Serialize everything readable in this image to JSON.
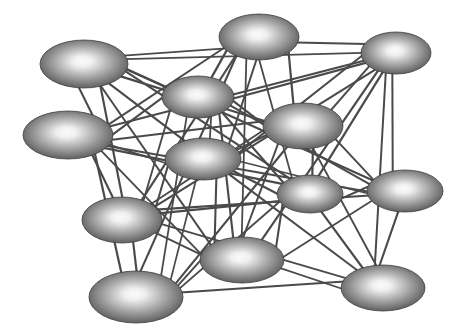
{
  "figure": {
    "type": "node-link-diagram",
    "width": 466,
    "height": 332,
    "background_color": "#ffffff",
    "node_count": 14,
    "edge_count": 86
  },
  "style": {
    "edge_color": "#4a4a4a",
    "edge_width": 2.0,
    "node_fill_center": "#f2f2f2",
    "node_fill_mid": "#9a9a9a",
    "node_fill_edge": "#4e4e4e",
    "node_outline": "#3d3d3d",
    "node_outline_width": 0.8
  },
  "nodes": [
    {
      "id": "n1",
      "label": "node-top-left",
      "cx": 84,
      "cy": 64,
      "rx": 44,
      "ry": 24
    },
    {
      "id": "n2",
      "label": "node-top-center",
      "cx": 259,
      "cy": 37,
      "rx": 40,
      "ry": 23
    },
    {
      "id": "n3",
      "label": "node-top-right",
      "cx": 396,
      "cy": 53,
      "rx": 35,
      "ry": 21
    },
    {
      "id": "n4",
      "label": "node-upper-mid-left",
      "cx": 198,
      "cy": 97,
      "rx": 36,
      "ry": 21
    },
    {
      "id": "n5",
      "label": "node-left-upper",
      "cx": 68,
      "cy": 135,
      "rx": 45,
      "ry": 24
    },
    {
      "id": "n6",
      "label": "node-center-right",
      "cx": 303,
      "cy": 126,
      "rx": 40,
      "ry": 23
    },
    {
      "id": "n7",
      "label": "node-center",
      "cx": 203,
      "cy": 159,
      "rx": 38,
      "ry": 21
    },
    {
      "id": "n8",
      "label": "node-mid-right",
      "cx": 310,
      "cy": 194,
      "rx": 33,
      "ry": 19
    },
    {
      "id": "n9",
      "label": "node-right-lower",
      "cx": 405,
      "cy": 191,
      "rx": 38,
      "ry": 21
    },
    {
      "id": "n10",
      "label": "node-left-lower",
      "cx": 122,
      "cy": 220,
      "rx": 40,
      "ry": 23
    },
    {
      "id": "n11",
      "label": "node-bottom-center",
      "cx": 242,
      "cy": 260,
      "rx": 42,
      "ry": 23
    },
    {
      "id": "n12",
      "label": "node-bottom-left",
      "cx": 136,
      "cy": 297,
      "rx": 47,
      "ry": 26
    },
    {
      "id": "n13",
      "label": "node-bottom-right",
      "cx": 383,
      "cy": 288,
      "rx": 42,
      "ry": 23
    },
    {
      "id": "n14",
      "label": "node-far-right-stub",
      "cx": 430,
      "cy": 52,
      "rx": 0,
      "ry": 0
    }
  ],
  "chart_data": {
    "type": "graph",
    "xlabel": "",
    "ylabel": "",
    "node_ids": [
      "n1",
      "n2",
      "n3",
      "n4",
      "n5",
      "n6",
      "n7",
      "n8",
      "n9",
      "n10",
      "n11",
      "n12",
      "n13"
    ],
    "edges": [
      [
        "n1",
        "n2"
      ],
      [
        "n1",
        "n3"
      ],
      [
        "n1",
        "n4"
      ],
      [
        "n1",
        "n5"
      ],
      [
        "n1",
        "n6"
      ],
      [
        "n1",
        "n7"
      ],
      [
        "n1",
        "n8"
      ],
      [
        "n1",
        "n9"
      ],
      [
        "n1",
        "n10"
      ],
      [
        "n1",
        "n11"
      ],
      [
        "n2",
        "n3"
      ],
      [
        "n2",
        "n4"
      ],
      [
        "n2",
        "n5"
      ],
      [
        "n2",
        "n6"
      ],
      [
        "n2",
        "n7"
      ],
      [
        "n2",
        "n8"
      ],
      [
        "n2",
        "n10"
      ],
      [
        "n2",
        "n11"
      ],
      [
        "n2",
        "n12"
      ],
      [
        "n3",
        "n4"
      ],
      [
        "n3",
        "n5"
      ],
      [
        "n3",
        "n6"
      ],
      [
        "n3",
        "n7"
      ],
      [
        "n3",
        "n8"
      ],
      [
        "n3",
        "n9"
      ],
      [
        "n3",
        "n10"
      ],
      [
        "n3",
        "n11"
      ],
      [
        "n3",
        "n13"
      ],
      [
        "n4",
        "n5"
      ],
      [
        "n4",
        "n6"
      ],
      [
        "n4",
        "n7"
      ],
      [
        "n4",
        "n8"
      ],
      [
        "n4",
        "n9"
      ],
      [
        "n4",
        "n10"
      ],
      [
        "n4",
        "n11"
      ],
      [
        "n4",
        "n12"
      ],
      [
        "n5",
        "n6"
      ],
      [
        "n5",
        "n7"
      ],
      [
        "n5",
        "n8"
      ],
      [
        "n5",
        "n9"
      ],
      [
        "n5",
        "n10"
      ],
      [
        "n5",
        "n11"
      ],
      [
        "n5",
        "n12"
      ],
      [
        "n6",
        "n7"
      ],
      [
        "n6",
        "n8"
      ],
      [
        "n6",
        "n9"
      ],
      [
        "n6",
        "n10"
      ],
      [
        "n6",
        "n11"
      ],
      [
        "n6",
        "n12"
      ],
      [
        "n6",
        "n13"
      ],
      [
        "n7",
        "n8"
      ],
      [
        "n7",
        "n9"
      ],
      [
        "n7",
        "n10"
      ],
      [
        "n7",
        "n11"
      ],
      [
        "n7",
        "n12"
      ],
      [
        "n7",
        "n13"
      ],
      [
        "n8",
        "n9"
      ],
      [
        "n8",
        "n10"
      ],
      [
        "n8",
        "n11"
      ],
      [
        "n8",
        "n12"
      ],
      [
        "n8",
        "n13"
      ],
      [
        "n9",
        "n10"
      ],
      [
        "n9",
        "n11"
      ],
      [
        "n9",
        "n13"
      ],
      [
        "n10",
        "n11"
      ],
      [
        "n10",
        "n12"
      ],
      [
        "n10",
        "n13"
      ],
      [
        "n11",
        "n12"
      ],
      [
        "n11",
        "n13"
      ],
      [
        "n12",
        "n13"
      ]
    ],
    "directed": false,
    "weighted": false,
    "grid": false,
    "legend": false
  }
}
